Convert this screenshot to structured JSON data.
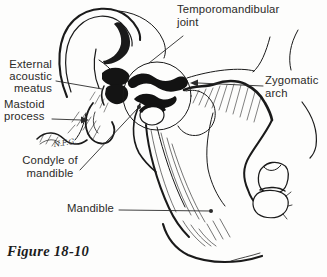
{
  "figure": {
    "caption": "Figure 18-10",
    "signature": "N.F.G."
  },
  "labels": {
    "temporomandibular_joint": {
      "line1": "Temporomandibular",
      "line2": "joint"
    },
    "external_acoustic_meatus": {
      "line1": "External",
      "line2": "acoustic",
      "line3": "meatus"
    },
    "mastoid_process": {
      "line1": "Mastoid",
      "line2": "process"
    },
    "condyle_of_mandible": {
      "line1": "Condyle of",
      "line2": "mandible"
    },
    "mandible": {
      "line1": "Mandible"
    },
    "zygomatic_arch": {
      "line1": "Zygomatic",
      "line2": "arch"
    }
  },
  "colors": {
    "ink": "#1a1a1a",
    "background": "#fdfdfc",
    "label_text": "#2b2a28"
  }
}
